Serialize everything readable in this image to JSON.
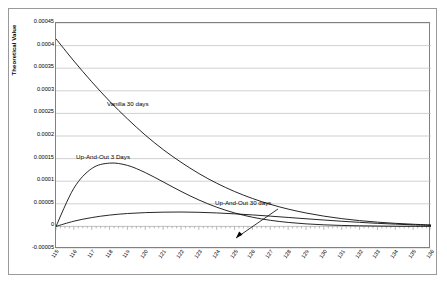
{
  "chart_data": {
    "type": "line",
    "title": "",
    "xlabel": "",
    "ylabel": "Theoretical Value",
    "xlim": [
      115,
      136
    ],
    "ylim": [
      -5e-05,
      0.00045
    ],
    "grid": true,
    "legend_position": "inline-annotations",
    "y_ticks": [
      "0.00045",
      "0.0004",
      "0.00035",
      "0.0003",
      "0.00025",
      "0.0002",
      "0.00015",
      "0.0001",
      "0.00005",
      "0",
      "-0.00005"
    ],
    "y_tick_values": [
      0.00045,
      0.0004,
      0.00035,
      0.0003,
      0.00025,
      0.0002,
      0.00015,
      0.0001,
      5e-05,
      0,
      -5e-05
    ],
    "x_ticks": [
      "115",
      "116",
      "117",
      "118",
      "119",
      "120",
      "121",
      "122",
      "123",
      "124",
      "125",
      "126",
      "127",
      "128",
      "129",
      "130",
      "131",
      "132",
      "133",
      "134",
      "135",
      "136"
    ],
    "x": [
      115,
      116,
      117,
      118,
      119,
      120,
      121,
      122,
      123,
      124,
      125,
      126,
      127,
      128,
      129,
      130,
      131,
      132,
      133,
      134,
      135,
      136
    ],
    "series": [
      {
        "name": "Vanilla 30 days",
        "color": "#000000",
        "values": [
          0.000415,
          0.000366,
          0.00032,
          0.000277,
          0.000238,
          0.000202,
          0.00017,
          0.000142,
          0.000117,
          9.55e-05,
          7.72e-05,
          6.18e-05,
          4.89e-05,
          3.83e-05,
          2.97e-05,
          2.27e-05,
          1.72e-05,
          1.28e-05,
          9.4e-06,
          6.8e-06,
          4.8e-06,
          3.2e-06
        ]
      },
      {
        "name": "Up-And-Out 3 Days",
        "color": "#000000",
        "values": [
          0.0,
          8.45e-05,
          0.000128,
          0.00014,
          0.000135,
          0.000119,
          9.85e-05,
          7.75e-05,
          5.85e-05,
          4.25e-05,
          2.98e-05,
          2.03e-05,
          1.35e-05,
          8.8e-06,
          5.6e-06,
          3.5e-06,
          2.1e-06,
          1.3e-06,
          8e-07,
          4e-07,
          2e-07,
          1e-07
        ]
      },
      {
        "name": "Up-And-Out 30 days",
        "color": "#000000",
        "values": [
          0.0,
          1.15e-05,
          1.95e-05,
          2.5e-05,
          2.85e-05,
          3.05e-05,
          3.15e-05,
          3.18e-05,
          3.12e-05,
          2.98e-05,
          2.78e-05,
          2.54e-05,
          2.27e-05,
          1.98e-05,
          1.69e-05,
          1.41e-05,
          1.14e-05,
          9e-06,
          6.8e-06,
          5e-06,
          3.4e-06,
          2.2e-06
        ]
      }
    ],
    "annotations": [
      {
        "text": "Vanilla 30 days"
      },
      {
        "text": "Up-And-Out 3 Days"
      },
      {
        "text": "Up-And-Out 30 days"
      }
    ]
  }
}
